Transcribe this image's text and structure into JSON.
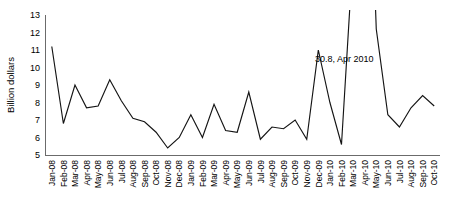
{
  "chart_data": {
    "type": "line",
    "title": "",
    "xlabel": "",
    "ylabel": "Billion dollars",
    "ylim": [
      5,
      13
    ],
    "yticks": [
      5,
      6,
      7,
      8,
      9,
      10,
      11,
      12,
      13
    ],
    "grid": false,
    "legend": null,
    "categories": [
      "Jan-08",
      "Feb-08",
      "Mar-08",
      "Apr-08",
      "May-08",
      "Jun-08",
      "Jul-08",
      "Aug-08",
      "Sep-08",
      "Oct-08",
      "Nov-08",
      "Dec-08",
      "Jan-09",
      "Feb-09",
      "Mar-09",
      "Apr-09",
      "May-09",
      "Jun-09",
      "Jul-09",
      "Aug-09",
      "Sep-09",
      "Oct-09",
      "Nov-09",
      "Dec-09",
      "Jan-10",
      "Feb-10",
      "Mar-10",
      "Apr-10",
      "May-10",
      "Jun-10",
      "Jul-10",
      "Aug-10",
      "Sep-10",
      "Oct-10"
    ],
    "values": [
      11.2,
      6.8,
      9.0,
      7.7,
      7.8,
      9.3,
      8.1,
      7.1,
      6.9,
      6.3,
      5.4,
      6.0,
      7.3,
      6.0,
      7.9,
      6.4,
      6.3,
      8.6,
      5.9,
      6.6,
      6.5,
      7.0,
      5.9,
      11.0,
      8.0,
      5.6,
      16.5,
      30.8,
      12.2,
      7.3,
      6.6,
      7.7,
      8.4,
      7.8
    ],
    "annotations": [
      {
        "text": "30.8, Apr 2010",
        "category": "Apr-10",
        "value": 30.8
      }
    ]
  },
  "axes": {
    "y_axis_title": "Billion dollars"
  }
}
